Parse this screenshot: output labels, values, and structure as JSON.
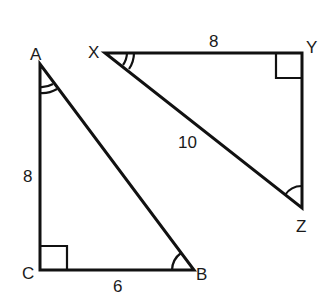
{
  "diagram": {
    "type": "similar-right-triangles",
    "background": "#ffffff",
    "stroke_color": "#111111",
    "triangles": [
      {
        "name": "ABC",
        "vertices": {
          "A": {
            "label": "A"
          },
          "B": {
            "label": "B"
          },
          "C": {
            "label": "C"
          }
        },
        "sides": [
          {
            "between": "A-C",
            "label": "8"
          },
          {
            "between": "C-B",
            "label": "6"
          }
        ],
        "right_angle_at": "C",
        "double_arc_angle_at": "A",
        "single_arc_angle_at": "B"
      },
      {
        "name": "XYZ",
        "vertices": {
          "X": {
            "label": "X"
          },
          "Y": {
            "label": "Y"
          },
          "Z": {
            "label": "Z"
          }
        },
        "sides": [
          {
            "between": "X-Y",
            "label": "8"
          },
          {
            "between": "X-Z",
            "label": "10"
          }
        ],
        "right_angle_at": "Y",
        "double_arc_angle_at": "X",
        "single_arc_angle_at": "Z"
      }
    ]
  },
  "labels": {
    "A": "A",
    "B": "B",
    "C": "C",
    "X": "X",
    "Y": "Y",
    "Z": "Z",
    "side_AC": "8",
    "side_CB": "6",
    "side_XY": "8",
    "side_XZ": "10"
  }
}
